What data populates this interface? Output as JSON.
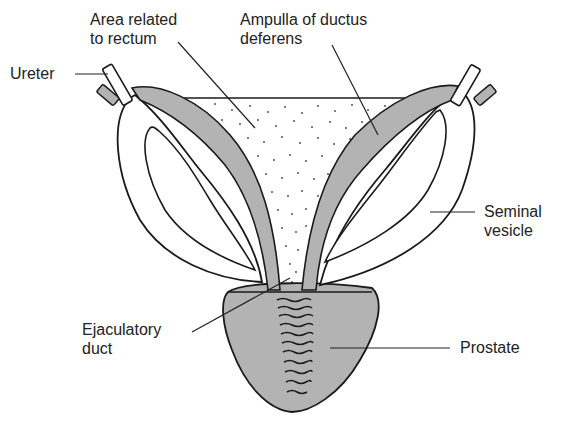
{
  "diagram": {
    "colors": {
      "background": "#ffffff",
      "outline": "#1a1a1a",
      "shaded": "#b3b3b3",
      "stipple": "#555555",
      "label_text": "#222222",
      "leader_line": "#222222"
    },
    "labels": [
      {
        "id": "area-related-to-rectum",
        "lines": [
          "Area related",
          "to rectum"
        ]
      },
      {
        "id": "ampulla-of-ductus-deferens",
        "lines": [
          "Ampulla of ductus",
          "deferens"
        ]
      },
      {
        "id": "ureter",
        "lines": [
          "Ureter"
        ]
      },
      {
        "id": "seminal-vesicle",
        "lines": [
          "Seminal",
          "vesicle"
        ]
      },
      {
        "id": "ejaculatory-duct",
        "lines": [
          "Ejaculatory",
          "duct"
        ]
      },
      {
        "id": "prostate",
        "lines": [
          "Prostate"
        ]
      }
    ]
  }
}
